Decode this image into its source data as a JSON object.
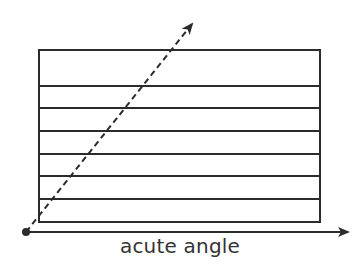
{
  "diagram": {
    "caption": "acute angle",
    "colors": {
      "stroke": "#2b2b2b",
      "text": "#333333",
      "background": "#ffffff"
    },
    "rectangle": {
      "x": 39,
      "y": 50,
      "width": 281,
      "height": 172
    },
    "stripe_lines_y": [
      86,
      108,
      131,
      154,
      176,
      199
    ],
    "vertex": {
      "x": 26,
      "y": 232
    },
    "horizontal_ray": {
      "x2": 350,
      "y2": 232,
      "style": "solid"
    },
    "angled_ray": {
      "x2": 193,
      "y2": 22,
      "style": "dashed"
    }
  }
}
